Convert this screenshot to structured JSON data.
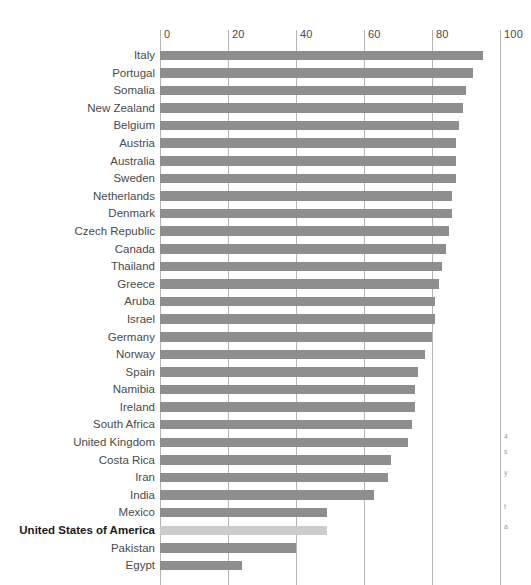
{
  "chart_data": {
    "type": "bar",
    "orientation": "horizontal",
    "title": "",
    "xlabel": "",
    "ylabel": "",
    "xlim": [
      0,
      100
    ],
    "grid": true,
    "grid_axis": "x",
    "legend": "none",
    "bar_color": "#8e8e8e",
    "highlight_color": "#cccccc",
    "highlight_category": "United States of America",
    "xticks": [
      0,
      20,
      40,
      60,
      80,
      100
    ],
    "xtick_labels": [
      "0",
      "20",
      "40",
      "60",
      "80",
      "100"
    ],
    "categories": [
      "Italy",
      "Portugal",
      "Somalia",
      "New Zealand",
      "Belgium",
      "Austria",
      "Australia",
      "Sweden",
      "Netherlands",
      "Denmark",
      "Czech Republic",
      "Canada",
      "Thailand",
      "Greece",
      "Aruba",
      "Israel",
      "Germany",
      "Norway",
      "Spain",
      "Namibia",
      "Ireland",
      "South Africa",
      "United Kingdom",
      "Costa Rica",
      "Iran",
      "India",
      "Mexico",
      "United States of America",
      "Pakistan",
      "Egypt"
    ],
    "values": [
      95,
      92,
      90,
      89,
      88,
      87,
      87,
      87,
      86,
      86,
      85,
      84,
      83,
      82,
      81,
      81,
      80,
      78,
      76,
      75,
      75,
      74,
      73,
      68,
      67,
      63,
      49,
      49,
      40,
      24
    ]
  },
  "axis": {
    "ticks": [
      {
        "label": "0",
        "value": 0
      },
      {
        "label": "20",
        "value": 20
      },
      {
        "label": "40",
        "value": 40
      },
      {
        "label": "60",
        "value": 60
      },
      {
        "label": "80",
        "value": 80
      },
      {
        "label": "100",
        "value": 100
      }
    ]
  },
  "right_margin_fragments": [
    {
      "text": "4",
      "top": 432
    },
    {
      "text": "s",
      "top": 447
    },
    {
      "text": "y",
      "top": 468
    },
    {
      "text": "t",
      "top": 502
    },
    {
      "text": "a",
      "top": 522
    }
  ]
}
